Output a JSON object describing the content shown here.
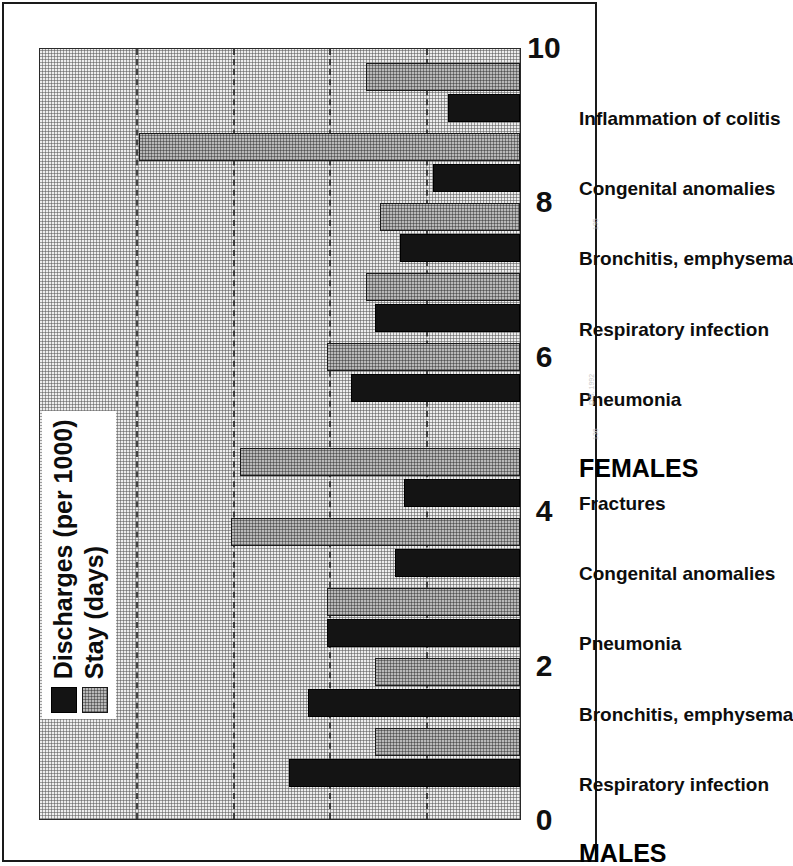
{
  "figure": {
    "legend": {
      "position": "inside-top-left",
      "entries": [
        {
          "label": "Discharges (per 1000)",
          "swatch": "black-solid"
        },
        {
          "label": "Stay (days)",
          "swatch": "gray-screened"
        }
      ]
    },
    "colors": {
      "discharges": "#141414",
      "stay": "#b9b9b9",
      "plot_background": "#ededed",
      "axis": "#1a1a1a",
      "text": "#0d0d0d"
    }
  },
  "chart_data": {
    "type": "bar",
    "orientation": "horizontal",
    "title": "",
    "subtitle": "",
    "xlabel": "",
    "ylabel": "",
    "ylim": [
      0,
      10
    ],
    "grid": true,
    "tick_labels": [
      "0",
      "2",
      "4",
      "6",
      "8",
      "10"
    ],
    "tick_values": [
      0,
      2,
      4,
      6,
      8,
      10
    ],
    "group_labels": [
      "MALES",
      "FEMALES"
    ],
    "categories": [
      "Respiratory infection",
      "Bronchitis, emphysema",
      "Pneumonia",
      "Congenital anomalies",
      "Fractures",
      "Pneumonia",
      "Respiratory infection",
      "Bronchitis, emphysema",
      "Congenital anomalies",
      "Inflammation of colitis"
    ],
    "category_groups": [
      "MALES",
      "MALES",
      "MALES",
      "MALES",
      "MALES",
      "FEMALES",
      "FEMALES",
      "FEMALES",
      "FEMALES",
      "FEMALES"
    ],
    "series": [
      {
        "name": "Discharges (per 1000)",
        "values": [
          4.8,
          4.4,
          4.0,
          2.6,
          2.4,
          3.5,
          3.0,
          2.5,
          1.8,
          1.5
        ]
      },
      {
        "name": "Stay (days)",
        "values": [
          3.0,
          3.0,
          4.0,
          6.0,
          5.8,
          4.0,
          3.2,
          2.9,
          7.9,
          3.2
        ]
      }
    ]
  },
  "scan_marks": [
    "195",
    "D.S. 1992",
    "136"
  ]
}
